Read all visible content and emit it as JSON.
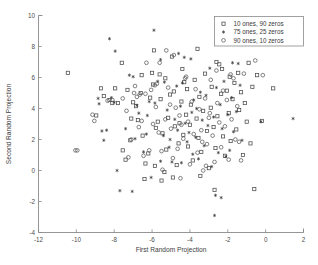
{
  "chart_data": {
    "type": "scatter",
    "title": "",
    "xlabel": "First Random Projection",
    "ylabel": "Second Random Projection",
    "xlim": [
      -12,
      2
    ],
    "ylim": [
      -4,
      10
    ],
    "xticks": [
      -12,
      -10,
      -8,
      -6,
      -4,
      -2,
      0,
      2
    ],
    "yticks": [
      -4,
      -2,
      0,
      2,
      4,
      6,
      8,
      10
    ],
    "xticklabels": [
      "-12",
      "-10",
      "-8",
      "-6",
      "-4",
      "-2",
      "0",
      "2"
    ],
    "yticklabels": [
      "-4",
      "-2",
      "0",
      "2",
      "4",
      "6",
      "8",
      "10"
    ],
    "grid": false,
    "legend_position": "upper right",
    "series": [
      {
        "name": "10 ones, 90 zeros",
        "marker": "square",
        "color": "#4a4a4a",
        "points": [
          [
            -10.45,
            6.3
          ],
          [
            -8.7,
            5.3
          ],
          [
            -8.55,
            4.8
          ],
          [
            -8.25,
            4.55
          ],
          [
            -8.1,
            4.35
          ],
          [
            -7.95,
            5.3
          ],
          [
            -7.8,
            4.35
          ],
          [
            -7.6,
            6.95
          ],
          [
            -7.3,
            5.2
          ],
          [
            -7.1,
            3.35
          ],
          [
            -7.55,
            1.3
          ],
          [
            -7.4,
            0.7
          ],
          [
            -7.15,
            1.95
          ],
          [
            -7.0,
            4.4
          ],
          [
            -6.85,
            4.15
          ],
          [
            -6.75,
            3.25
          ],
          [
            -6.6,
            5.0
          ],
          [
            -6.5,
            2.25
          ],
          [
            -6.35,
            0.45
          ],
          [
            -6.2,
            1.1
          ],
          [
            -6.1,
            4.7
          ],
          [
            -6.0,
            6.3
          ],
          [
            -5.95,
            5.55
          ],
          [
            -5.85,
            0.3
          ],
          [
            -5.8,
            2.75
          ],
          [
            -5.7,
            3.15
          ],
          [
            -5.6,
            6.2
          ],
          [
            -5.55,
            4.6
          ],
          [
            -5.45,
            2.4
          ],
          [
            -5.35,
            -0.1
          ],
          [
            -5.25,
            1.35
          ],
          [
            -5.15,
            3.4
          ],
          [
            -5.05,
            4.9
          ],
          [
            -4.95,
            7.35
          ],
          [
            -4.85,
            5.1
          ],
          [
            -4.8,
            2.85
          ],
          [
            -4.7,
            0.35
          ],
          [
            -4.6,
            1.75
          ],
          [
            -4.55,
            3.05
          ],
          [
            -4.45,
            4.45
          ],
          [
            -4.35,
            2.3
          ],
          [
            -4.3,
            5.7
          ],
          [
            -4.2,
            3.6
          ],
          [
            -4.1,
            1.55
          ],
          [
            -4.0,
            2.95
          ],
          [
            -3.95,
            4.25
          ],
          [
            -3.85,
            0.65
          ],
          [
            -3.75,
            5.85
          ],
          [
            -3.65,
            3.35
          ],
          [
            -3.55,
            2.1
          ],
          [
            -3.5,
            4.75
          ],
          [
            -3.4,
            1.2
          ],
          [
            -3.3,
            3.85
          ],
          [
            -3.2,
            6.25
          ],
          [
            -3.1,
            2.55
          ],
          [
            -3.0,
            0.15
          ],
          [
            -2.9,
            4.05
          ],
          [
            -2.85,
            5.4
          ],
          [
            -2.75,
            2.8
          ],
          [
            -2.65,
            1.45
          ],
          [
            -2.55,
            3.5
          ],
          [
            -2.45,
            6.85
          ],
          [
            -2.35,
            4.95
          ],
          [
            -2.25,
            2.2
          ],
          [
            -2.15,
            0.95
          ],
          [
            -2.05,
            5.15
          ],
          [
            -1.95,
            3.7
          ],
          [
            -1.85,
            1.9
          ],
          [
            -1.75,
            4.6
          ],
          [
            -1.65,
            5.65
          ],
          [
            -1.55,
            2.65
          ],
          [
            -1.45,
            6.3
          ],
          [
            -1.4,
            3.9
          ],
          [
            -1.3,
            5.05
          ],
          [
            -1.2,
            1.0
          ],
          [
            -1.1,
            4.35
          ],
          [
            -1.0,
            3.15
          ],
          [
            -0.9,
            6.95
          ],
          [
            -0.8,
            1.75
          ],
          [
            -0.7,
            5.4
          ],
          [
            -0.6,
            -1.2
          ],
          [
            -0.45,
            6.15
          ],
          [
            -0.2,
            3.2
          ],
          [
            0.4,
            5.3
          ],
          [
            -8.95,
            3.55
          ],
          [
            -6.55,
            6.15
          ],
          [
            -5.9,
            7.75
          ],
          [
            -4.4,
            6.55
          ],
          [
            -3.6,
            7.85
          ],
          [
            -2.6,
            7.0
          ],
          [
            -2.3,
            6.55
          ],
          [
            -5.3,
            5.95
          ],
          [
            -4.15,
            5.25
          ],
          [
            -5.5,
            -0.65
          ],
          [
            -6.4,
            -0.55
          ],
          [
            -4.9,
            -0.45
          ],
          [
            -3.45,
            -0.35
          ],
          [
            -2.7,
            -1.25
          ],
          [
            -1.9,
            6.05
          ]
        ]
      },
      {
        "name": "75 ones, 25 zeros",
        "marker": "star",
        "color": "#2e2e2e",
        "points": [
          [
            -8.25,
            8.5
          ],
          [
            -7.95,
            7.7
          ],
          [
            -7.2,
            6.15
          ],
          [
            -7.0,
            6.05
          ],
          [
            -8.8,
            4.3
          ],
          [
            -8.65,
            2.55
          ],
          [
            -8.55,
            1.95
          ],
          [
            -8.4,
            2.6
          ],
          [
            -8.15,
            4.7
          ],
          [
            -8.0,
            4.4
          ],
          [
            -7.85,
            0.0
          ],
          [
            -7.7,
            -1.3
          ],
          [
            -7.4,
            2.7
          ],
          [
            -7.05,
            -1.35
          ],
          [
            -6.9,
            2.05
          ],
          [
            -6.7,
            3.7
          ],
          [
            -6.45,
            1.2
          ],
          [
            -6.3,
            2.35
          ],
          [
            -6.15,
            4.45
          ],
          [
            -6.05,
            -0.45
          ],
          [
            -5.85,
            4.35
          ],
          [
            -5.7,
            5.75
          ],
          [
            -5.55,
            0.6
          ],
          [
            -5.4,
            2.25
          ],
          [
            -5.2,
            3.9
          ],
          [
            -5.1,
            1.5
          ],
          [
            -4.95,
            0.55
          ],
          [
            -4.8,
            3.3
          ],
          [
            -4.65,
            2.6
          ],
          [
            -4.5,
            4.15
          ],
          [
            -4.4,
            5.65
          ],
          [
            -4.25,
            3.05
          ],
          [
            -4.15,
            1.85
          ],
          [
            -4.05,
            2.45
          ],
          [
            -3.9,
            3.75
          ],
          [
            -3.8,
            4.55
          ],
          [
            -3.7,
            2.15
          ],
          [
            -3.55,
            0.75
          ],
          [
            -3.45,
            5.05
          ],
          [
            -3.35,
            3.25
          ],
          [
            -3.25,
            1.6
          ],
          [
            -3.15,
            4.85
          ],
          [
            -3.05,
            2.9
          ],
          [
            -2.95,
            6.6
          ],
          [
            -2.85,
            0.25
          ],
          [
            -2.75,
            3.45
          ],
          [
            -2.6,
            5.35
          ],
          [
            -2.5,
            1.15
          ],
          [
            -2.4,
            4.25
          ],
          [
            -2.3,
            2.7
          ],
          [
            -2.2,
            5.75
          ],
          [
            -2.1,
            0.9
          ],
          [
            -2.0,
            3.6
          ],
          [
            -1.9,
            1.3
          ],
          [
            -1.8,
            4.7
          ],
          [
            -1.7,
            2.5
          ],
          [
            -1.55,
            3.8
          ],
          [
            -1.45,
            6.9
          ],
          [
            -1.35,
            5.5
          ],
          [
            -1.25,
            1.95
          ],
          [
            -2.65,
            -1.6
          ],
          [
            -2.35,
            -1.75
          ],
          [
            -2.7,
            -2.9
          ],
          [
            -5.55,
            7.15
          ],
          [
            -4.6,
            7.55
          ],
          [
            -4.3,
            7.3
          ],
          [
            -3.95,
            7.2
          ],
          [
            -5.9,
            9.05
          ],
          [
            -1.75,
            6.95
          ],
          [
            -0.25,
            3.15
          ],
          [
            1.45,
            3.35
          ],
          [
            -8.85,
            4.65
          ],
          [
            -6.8,
            4.2
          ],
          [
            -5.35,
            5.7
          ],
          [
            -4.7,
            5.45
          ],
          [
            -3.85,
            1.05
          ],
          [
            -6.25,
            3.55
          ],
          [
            -5.05,
            2.0
          ],
          [
            -4.45,
            0.5
          ],
          [
            -3.65,
            4.0
          ]
        ]
      },
      {
        "name": "90 ones, 10 zeros",
        "marker": "circle",
        "color": "#5a5a5a",
        "points": [
          [
            -9.15,
            3.6
          ],
          [
            -9.05,
            3.2
          ],
          [
            -10.05,
            1.3
          ],
          [
            -9.95,
            1.3
          ],
          [
            -8.35,
            4.5
          ],
          [
            -8.1,
            4.55
          ],
          [
            -7.55,
            4.65
          ],
          [
            -7.35,
            3.85
          ],
          [
            -7.25,
            0.85
          ],
          [
            -7.1,
            2.0
          ],
          [
            -6.95,
            5.0
          ],
          [
            -6.8,
            4.75
          ],
          [
            -6.65,
            4.9
          ],
          [
            -6.55,
            3.2
          ],
          [
            -6.45,
            0.95
          ],
          [
            -6.35,
            4.95
          ],
          [
            -6.3,
            6.95
          ],
          [
            -6.15,
            1.3
          ],
          [
            -6.05,
            5.2
          ],
          [
            -5.95,
            3.0
          ],
          [
            -5.85,
            5.5
          ],
          [
            -5.75,
            5.6
          ],
          [
            -5.65,
            2.45
          ],
          [
            -5.5,
            1.25
          ],
          [
            -5.45,
            0.05
          ],
          [
            -5.3,
            3.3
          ],
          [
            -5.15,
            5.35
          ],
          [
            -5.0,
            2.7
          ],
          [
            -4.9,
            0.8
          ],
          [
            -4.75,
            4.05
          ],
          [
            -4.65,
            1.4
          ],
          [
            -4.55,
            3.55
          ],
          [
            -4.5,
            -0.5
          ],
          [
            -4.35,
            2.05
          ],
          [
            -4.25,
            5.95
          ],
          [
            -4.1,
            3.15
          ],
          [
            -4.0,
            0.4
          ],
          [
            -3.9,
            4.45
          ],
          [
            -3.8,
            2.35
          ],
          [
            -3.7,
            5.25
          ],
          [
            -3.6,
            1.15
          ],
          [
            -3.5,
            3.95
          ],
          [
            -3.4,
            2.6
          ],
          [
            -3.3,
            0.0
          ],
          [
            -3.2,
            4.65
          ],
          [
            -3.1,
            1.7
          ],
          [
            -3.0,
            3.4
          ],
          [
            -2.9,
            5.85
          ],
          [
            -2.8,
            2.25
          ],
          [
            -2.7,
            0.55
          ],
          [
            -2.55,
            4.35
          ],
          [
            -2.45,
            3.1
          ],
          [
            -2.35,
            1.5
          ],
          [
            -2.25,
            5.15
          ],
          [
            -2.15,
            2.85
          ],
          [
            -2.05,
            4.55
          ],
          [
            -1.95,
            0.7
          ],
          [
            -1.8,
            3.3
          ],
          [
            -1.7,
            5.95
          ],
          [
            -1.6,
            2.0
          ],
          [
            -1.5,
            4.15
          ],
          [
            -1.3,
            0.65
          ],
          [
            -1.15,
            6.25
          ],
          [
            -5.25,
            7.75
          ],
          [
            -4.85,
            7.45
          ],
          [
            -5.6,
            6.95
          ],
          [
            -4.2,
            6.05
          ],
          [
            -2.6,
            6.45
          ],
          [
            -1.85,
            6.2
          ],
          [
            -0.55,
            7.1
          ],
          [
            -0.15,
            6.15
          ],
          [
            -6.7,
            2.8
          ],
          [
            -5.05,
            4.25
          ],
          [
            -4.45,
            2.95
          ],
          [
            -3.35,
            1.85
          ],
          [
            -2.95,
            3.7
          ],
          [
            -1.4,
            1.85
          ],
          [
            -6.9,
            5.45
          ],
          [
            -5.8,
            4.1
          ],
          [
            -3.15,
            0.3
          ]
        ]
      }
    ]
  },
  "legend": {
    "entries": [
      {
        "label": "10 ones, 90 zeros",
        "marker": "square"
      },
      {
        "label": "75 ones, 25 zeros",
        "marker": "star"
      },
      {
        "label": "90 ones, 10 zeros",
        "marker": "circle"
      }
    ]
  }
}
